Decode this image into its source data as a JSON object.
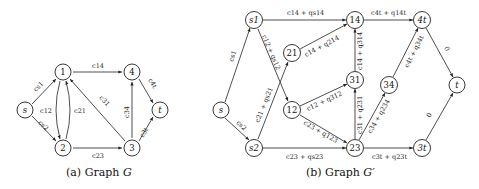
{
  "graph_g": {
    "caption_prefix": "(a) Graph ",
    "caption_var": "G",
    "nodes": {
      "s": {
        "label": "s",
        "x": 25,
        "y": 110
      },
      "n1": {
        "label": "1",
        "x": 63,
        "y": 72
      },
      "n2": {
        "label": "2",
        "x": 63,
        "y": 148
      },
      "n4": {
        "label": "4",
        "x": 132,
        "y": 72
      },
      "n3": {
        "label": "3",
        "x": 132,
        "y": 148
      },
      "t": {
        "label": "t",
        "x": 160,
        "y": 110
      }
    },
    "edge_labels": {
      "cs1": "cs1",
      "cs2": "cs2",
      "c12": "c12",
      "c21": "c21",
      "c14": "c14",
      "c23": "c23",
      "c31": "c31",
      "c34": "c34",
      "c4t": "c4t",
      "c3t": "c3t"
    }
  },
  "graph_gprime": {
    "caption_prefix": "(b) Graph ",
    "caption_var": "G′",
    "nodes": {
      "s": {
        "label": "s",
        "x": 221,
        "y": 110
      },
      "s1": {
        "label": "s1",
        "x": 254,
        "y": 20
      },
      "s2": {
        "label": "s2",
        "x": 254,
        "y": 148
      },
      "n21": {
        "label": "21",
        "x": 292,
        "y": 53
      },
      "n12": {
        "label": "12",
        "x": 292,
        "y": 110
      },
      "n14": {
        "label": "14",
        "x": 355,
        "y": 20
      },
      "n31": {
        "label": "31",
        "x": 355,
        "y": 80
      },
      "n23": {
        "label": "23",
        "x": 355,
        "y": 148
      },
      "n34": {
        "label": "34",
        "x": 389,
        "y": 85
      },
      "n4t": {
        "label": "4t",
        "x": 422,
        "y": 20
      },
      "n3t": {
        "label": "3t",
        "x": 422,
        "y": 148
      },
      "t": {
        "label": "t",
        "x": 457,
        "y": 85
      }
    },
    "edge_labels": {
      "cs1": "cs1",
      "cs2": "cs2",
      "s1_14": "c14 + qs14",
      "s1_12": "c12 + qs12",
      "s2_21": "c21 + qs21",
      "s2_23": "c23 + qs23",
      "n21_14": "c14 + q214",
      "n12_31": "c12 + q312",
      "n12_23": "c23 + q123",
      "n31_14": "c14 + q314",
      "n23_31": "c31 + q231",
      "n23_34": "c34 + q234",
      "n14_4t": "c4t + q14t",
      "n34_4t": "c4t + q34t",
      "n23_3t": "c3t + q23t",
      "n4t_t": "0",
      "n3t_t": "0"
    }
  }
}
